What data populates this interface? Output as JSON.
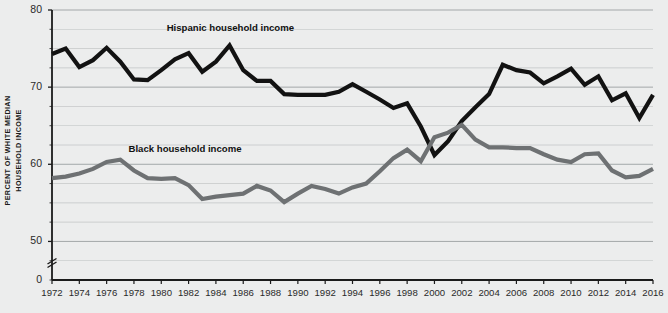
{
  "chart_data": {
    "type": "line",
    "title": "",
    "subtitle": "",
    "xlabel": "",
    "ylabel": "PERCENT OF WHITE MEDIAN HOUSEHOLD INCOME",
    "ylabel_lines": [
      "PERCENT OF WHITE MEDIAN",
      "HOUSEHOLD INCOME"
    ],
    "ylim": [
      45,
      80
    ],
    "y_axis_broken": true,
    "y_break_symbol": "≈",
    "y_ticks": [
      80,
      70,
      60,
      50,
      0
    ],
    "y_tick_labels": [
      "80",
      "70",
      "60",
      "50",
      "0"
    ],
    "gridlines": true,
    "gridline_interval": 2.5,
    "grid_color": "#8f9496",
    "background_color": "#eceded",
    "axis_color": "#1b1b1b",
    "legend_position": "inline-annotation",
    "xlim": [
      1972,
      2016
    ],
    "x_tick_interval": 2,
    "x_ticks": [
      1972,
      1974,
      1976,
      1978,
      1980,
      1982,
      1984,
      1986,
      1988,
      1990,
      1992,
      1994,
      1996,
      1998,
      2000,
      2002,
      2004,
      2006,
      2008,
      2010,
      2012,
      2014,
      2016
    ],
    "x_tick_labels": [
      "1972",
      "1974",
      "1976",
      "1978",
      "1980",
      "1982",
      "1984",
      "1986",
      "1988",
      "1990",
      "1992",
      "1994",
      "1996",
      "1998",
      "2000",
      "2002",
      "2004",
      "2006",
      "2008",
      "2010",
      "2012",
      "2014",
      "2016"
    ],
    "x": [
      1972,
      1973,
      1974,
      1975,
      1976,
      1977,
      1978,
      1979,
      1980,
      1981,
      1982,
      1983,
      1984,
      1985,
      1986,
      1987,
      1988,
      1989,
      1990,
      1991,
      1992,
      1993,
      1994,
      1995,
      1996,
      1997,
      1998,
      1999,
      2000,
      2001,
      2002,
      2003,
      2004,
      2005,
      2006,
      2007,
      2008,
      2009,
      2010,
      2011,
      2012,
      2013,
      2014,
      2015,
      2016
    ],
    "series": [
      {
        "name": "Hispanic household income",
        "color": "#121212",
        "label_x": 1980.4,
        "label_y": 77.6,
        "values": [
          74.3,
          75.0,
          72.6,
          73.5,
          75.1,
          73.3,
          71.0,
          70.9,
          72.2,
          73.6,
          74.4,
          72.0,
          73.3,
          75.4,
          72.2,
          70.8,
          70.8,
          69.1,
          69.0,
          69.0,
          69.0,
          69.4,
          70.4,
          69.4,
          68.4,
          67.3,
          67.9,
          64.9,
          61.2,
          63.0,
          65.6,
          67.4,
          69.1,
          72.9,
          72.2,
          71.9,
          70.5,
          71.4,
          72.4,
          70.3,
          71.4,
          68.3,
          69.2,
          66.0,
          69.0
        ],
        "endpoint_value": 72.9
      },
      {
        "name": "Black household income",
        "color": "#6e7173",
        "label_x": 1977.6,
        "label_y": 61.9,
        "values": [
          58.2,
          58.4,
          58.8,
          59.4,
          60.3,
          60.6,
          59.2,
          58.2,
          58.1,
          58.2,
          57.3,
          55.5,
          55.8,
          56.0,
          56.2,
          57.2,
          56.6,
          55.1,
          56.2,
          57.2,
          56.8,
          56.2,
          57.0,
          57.5,
          59.1,
          60.8,
          61.9,
          60.4,
          63.5,
          64.1,
          65.1,
          63.2,
          62.2,
          62.2,
          62.1,
          62.1,
          61.3,
          60.6,
          60.3,
          61.3,
          61.4,
          59.2,
          58.3,
          58.5,
          59.4
        ],
        "endpoint_value": 61.0
      }
    ]
  }
}
